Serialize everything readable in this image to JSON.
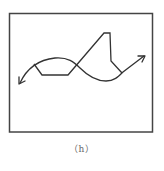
{
  "figure": {
    "caption": "（h）",
    "frame": {
      "x": 9.5,
      "y": 13.5,
      "width": 143,
      "height": 118.5
    },
    "stroke_color": "#333333",
    "curve_path": "M 20 83 C 26 70, 36 60, 55 58 C 68 57, 74 62, 80 68 C 88 76, 96 81, 106 81 C 114 81, 118 77, 123 72 L 144 56",
    "polyline_points": "34,64 42,75 68,75 104,33 110,33 111,61 122,73",
    "left_arrowhead": "M 19 84 L 19 77 M 19 84 L 25 81",
    "right_arrowhead": "M 145 56 L 138 56 M 145 56 L 142 62"
  }
}
